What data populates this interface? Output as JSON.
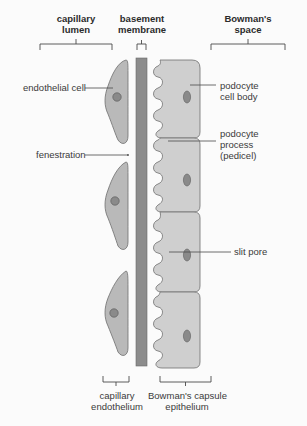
{
  "diagram": {
    "top_labels": {
      "capillary_lumen": [
        "capillary",
        "lumen"
      ],
      "basement_membrane": [
        "basement",
        "membrane"
      ],
      "bowmans_space": [
        "Bowman's",
        "space"
      ]
    },
    "side_labels": {
      "endothelial_cell": "endothelial cell",
      "fenestration": "fenestration",
      "podocyte_cell_body": [
        "podocyte",
        "cell body"
      ],
      "podocyte_process": [
        "podocyte",
        "process",
        "(pedicel)"
      ],
      "slit_pore": "slit pore"
    },
    "bottom_labels": {
      "capillary_endothelium": [
        "capillary",
        "endothelium"
      ],
      "bowmans_capsule_epithelium": [
        "Bowman's capsule",
        "epithelium"
      ]
    },
    "colors": {
      "background": "#fbfbfb",
      "cell_fill": "#b9b9b9",
      "cell_stroke": "#6e6e6e",
      "nucleus_fill": "#8a8a8a",
      "membrane_fill": "#8c8c8c",
      "podocyte_fill": "#cfcfcf",
      "line": "#4a4a4a",
      "text": "#3a3a3a"
    },
    "counts": {
      "endothelial_cells": 3,
      "podocytes": 4
    }
  }
}
